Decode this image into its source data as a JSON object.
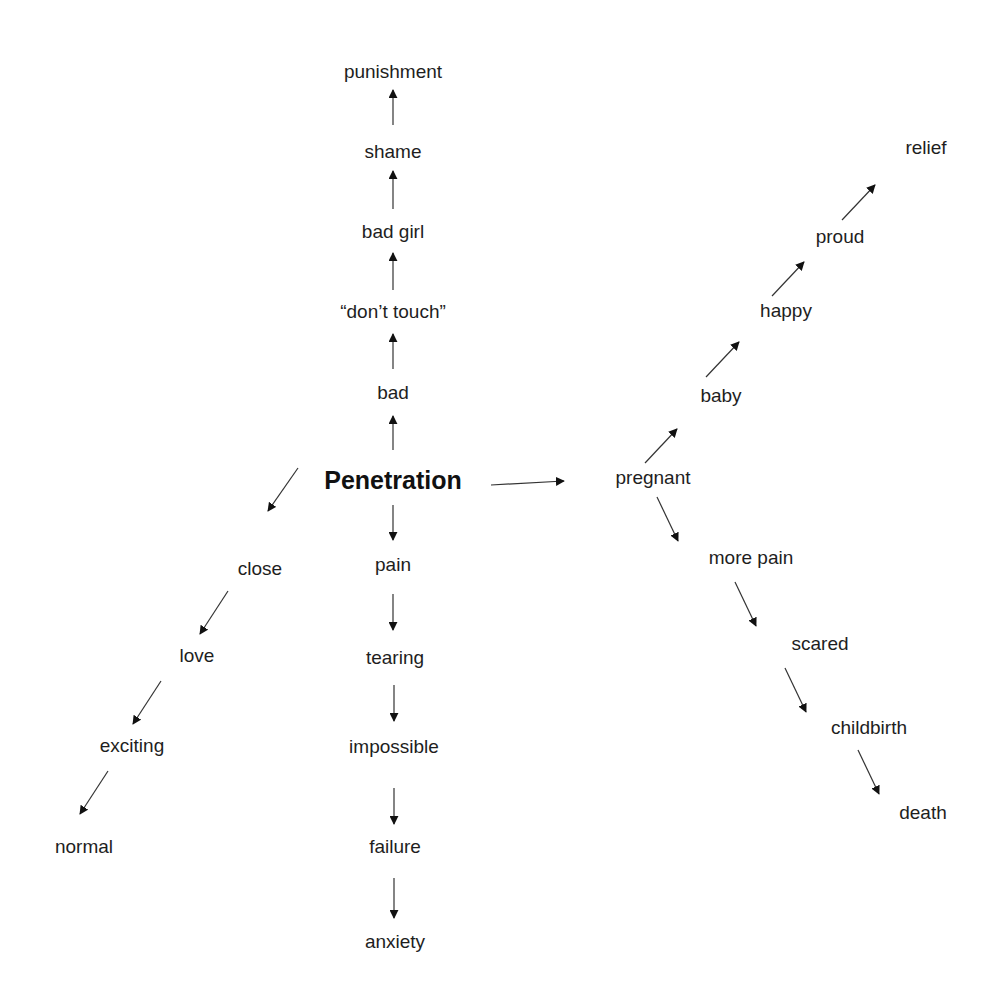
{
  "diagram": {
    "type": "concept-map",
    "central": {
      "label": "Penetration",
      "x": 393,
      "y": 480
    },
    "branches": {
      "up": [
        {
          "label": "bad",
          "x": 393,
          "y": 392
        },
        {
          "label": "“don’t touch”",
          "x": 393,
          "y": 311
        },
        {
          "label": "bad girl",
          "x": 393,
          "y": 231
        },
        {
          "label": "shame",
          "x": 393,
          "y": 151
        },
        {
          "label": "punishment",
          "x": 393,
          "y": 71
        }
      ],
      "down": [
        {
          "label": "pain",
          "x": 393,
          "y": 564
        },
        {
          "label": "tearing",
          "x": 395,
          "y": 657
        },
        {
          "label": "impossible",
          "x": 394,
          "y": 746
        },
        {
          "label": "failure",
          "x": 395,
          "y": 846
        },
        {
          "label": "anxiety",
          "x": 395,
          "y": 941
        }
      ],
      "down_left": [
        {
          "label": "close",
          "x": 260,
          "y": 568
        },
        {
          "label": "love",
          "x": 197,
          "y": 655
        },
        {
          "label": "exciting",
          "x": 132,
          "y": 745
        },
        {
          "label": "normal",
          "x": 84,
          "y": 846
        }
      ],
      "right": [
        {
          "label": "pregnant",
          "x": 653,
          "y": 477
        }
      ],
      "up_right": [
        {
          "label": "baby",
          "x": 721,
          "y": 395
        },
        {
          "label": "happy",
          "x": 786,
          "y": 310
        },
        {
          "label": "proud",
          "x": 840,
          "y": 236
        },
        {
          "label": "relief",
          "x": 926,
          "y": 147
        }
      ],
      "down_right": [
        {
          "label": "more pain",
          "x": 751,
          "y": 557
        },
        {
          "label": "scared",
          "x": 820,
          "y": 643
        },
        {
          "label": "childbirth",
          "x": 869,
          "y": 727
        },
        {
          "label": "death",
          "x": 923,
          "y": 812
        }
      ]
    },
    "arrows": [
      {
        "from": "Penetration",
        "to": "bad",
        "x1": 393,
        "y1": 450,
        "x2": 393,
        "y2": 416
      },
      {
        "from": "bad",
        "to": "don't touch",
        "x1": 393,
        "y1": 369,
        "x2": 393,
        "y2": 334
      },
      {
        "from": "don't touch",
        "to": "bad girl",
        "x1": 393,
        "y1": 290,
        "x2": 393,
        "y2": 253
      },
      {
        "from": "bad girl",
        "to": "shame",
        "x1": 393,
        "y1": 209,
        "x2": 393,
        "y2": 171
      },
      {
        "from": "shame",
        "to": "punishment",
        "x1": 393,
        "y1": 125,
        "x2": 393,
        "y2": 90
      },
      {
        "from": "Penetration",
        "to": "pain",
        "x1": 393,
        "y1": 505,
        "x2": 393,
        "y2": 540
      },
      {
        "from": "pain",
        "to": "tearing",
        "x1": 393,
        "y1": 594,
        "x2": 393,
        "y2": 630
      },
      {
        "from": "tearing",
        "to": "impossible",
        "x1": 394,
        "y1": 685,
        "x2": 394,
        "y2": 721
      },
      {
        "from": "impossible",
        "to": "failure",
        "x1": 394,
        "y1": 788,
        "x2": 394,
        "y2": 824
      },
      {
        "from": "failure",
        "to": "anxiety",
        "x1": 394,
        "y1": 878,
        "x2": 394,
        "y2": 918
      },
      {
        "from": "Penetration",
        "to": "close",
        "x1": 298,
        "y1": 468,
        "x2": 268,
        "y2": 511
      },
      {
        "from": "close",
        "to": "love",
        "x1": 228,
        "y1": 591,
        "x2": 200,
        "y2": 634
      },
      {
        "from": "love",
        "to": "exciting",
        "x1": 161,
        "y1": 681,
        "x2": 133,
        "y2": 724
      },
      {
        "from": "exciting",
        "to": "normal",
        "x1": 108,
        "y1": 771,
        "x2": 80,
        "y2": 814
      },
      {
        "from": "Penetration",
        "to": "pregnant",
        "x1": 491,
        "y1": 485,
        "x2": 564,
        "y2": 481
      },
      {
        "from": "pregnant",
        "to": "baby",
        "x1": 645,
        "y1": 463,
        "x2": 677,
        "y2": 429
      },
      {
        "from": "baby",
        "to": "happy",
        "x1": 706,
        "y1": 377,
        "x2": 739,
        "y2": 342
      },
      {
        "from": "happy",
        "to": "proud",
        "x1": 772,
        "y1": 296,
        "x2": 804,
        "y2": 262
      },
      {
        "from": "proud",
        "to": "relief",
        "x1": 842,
        "y1": 220,
        "x2": 875,
        "y2": 185
      },
      {
        "from": "pregnant",
        "to": "more pain",
        "x1": 657,
        "y1": 497,
        "x2": 678,
        "y2": 541
      },
      {
        "from": "more pain",
        "to": "scared",
        "x1": 735,
        "y1": 582,
        "x2": 756,
        "y2": 626
      },
      {
        "from": "scared",
        "to": "childbirth",
        "x1": 785,
        "y1": 668,
        "x2": 806,
        "y2": 712
      },
      {
        "from": "childbirth",
        "to": "death",
        "x1": 858,
        "y1": 750,
        "x2": 879,
        "y2": 794
      }
    ]
  }
}
